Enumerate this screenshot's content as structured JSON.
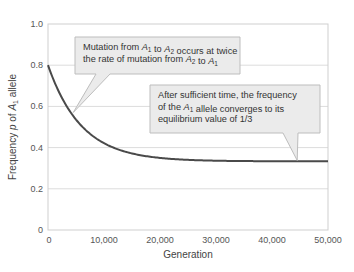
{
  "chart_data": {
    "type": "line",
    "title": "",
    "xlabel": "Generation",
    "ylabel_parts": [
      "Frequency ",
      "p",
      " of ",
      "A",
      "1",
      " allele"
    ],
    "ylabel": "Frequency p of A1 allele",
    "xlim": [
      0,
      50000
    ],
    "ylim": [
      0,
      1.0
    ],
    "x_ticks": [
      0,
      10000,
      20000,
      30000,
      40000,
      50000
    ],
    "x_tick_labels": [
      "0",
      "10,000",
      "20,000",
      "30,000",
      "40,000",
      "50,000"
    ],
    "y_ticks": [
      0,
      0.2,
      0.4,
      0.6,
      0.8,
      1.0
    ],
    "y_tick_labels": [
      "0",
      "0.2",
      "0.4",
      "0.6",
      "0.8",
      "1.0"
    ],
    "grid": "horizontal",
    "series": [
      {
        "name": "Frequency p of A1",
        "color": "#4a4a4a",
        "x": [
          0,
          2500,
          5000,
          7500,
          10000,
          12500,
          15000,
          17500,
          20000,
          25000,
          30000,
          35000,
          40000,
          45000,
          50000
        ],
        "values": [
          0.8,
          0.64,
          0.54,
          0.47,
          0.42,
          0.39,
          0.37,
          0.356,
          0.35,
          0.34,
          0.336,
          0.334,
          0.334,
          0.333,
          0.333
        ]
      }
    ],
    "equilibrium": 0.3333,
    "annotations": [
      {
        "id": "mutation-rate",
        "lines": [
          [
            {
              "t": "Mutation from "
            },
            {
              "t": "A",
              "i": true
            },
            {
              "t": "1",
              "sub": true
            },
            {
              "t": " to "
            },
            {
              "t": "A",
              "i": true
            },
            {
              "t": "2",
              "sub": true
            },
            {
              "t": " occurs at twice"
            }
          ],
          [
            {
              "t": "the rate of mutation from "
            },
            {
              "t": "A",
              "i": true
            },
            {
              "t": "2",
              "sub": true
            },
            {
              "t": " to "
            },
            {
              "t": "A",
              "i": true
            },
            {
              "t": "1",
              "sub": true
            }
          ]
        ],
        "text": "Mutation from A1 to A2 occurs at twice the rate of mutation from A2 to A1",
        "points_to": {
          "x": 4500,
          "y": 0.57
        }
      },
      {
        "id": "equilibrium",
        "lines": [
          [
            {
              "t": "After sufficient time, the frequency"
            }
          ],
          [
            {
              "t": "of the "
            },
            {
              "t": "A",
              "i": true
            },
            {
              "t": "1",
              "sub": true
            },
            {
              "t": " allele converges to its"
            }
          ],
          [
            {
              "t": "equilibrium value of 1/3"
            }
          ]
        ],
        "text": "After sufficient time, the frequency of the A1 allele converges to its equilibrium value of 1/3",
        "points_to": {
          "x": 44500,
          "y": 0.333
        }
      }
    ]
  },
  "colors": {
    "curve": "#4a4a4a",
    "grid": "#dcdcdc",
    "frame": "#cfcfcf",
    "callout_fill": "#ebebeb",
    "callout_stroke": "#bdbdbd"
  }
}
